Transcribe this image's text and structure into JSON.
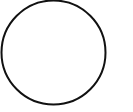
{
  "shape": {
    "type": "circle",
    "cx": 53.5,
    "cy": 52.5,
    "r": 52,
    "stroke": "#111111",
    "stroke_width": 2,
    "fill": "#ffffff"
  },
  "background": "#ffffff"
}
